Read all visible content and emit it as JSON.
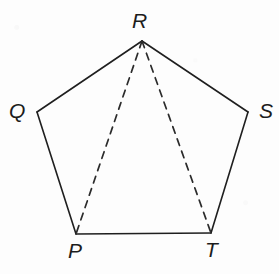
{
  "figure": {
    "shape_name": "pentagon",
    "background_color": "#fdfdfd",
    "solid_stroke_color": "#1f1f1f",
    "dashed_stroke_color": "#2b2b2b",
    "solid_stroke_width": 1.6,
    "dashed_stroke_width": 1.7,
    "dash_pattern": "7,6",
    "vertices": [
      {
        "id": "P",
        "label": "P",
        "x": 76,
        "y": 234,
        "label_x": 68,
        "label_y": 240
      },
      {
        "id": "Q",
        "label": "Q",
        "x": 37,
        "y": 112,
        "label_x": 9,
        "label_y": 100
      },
      {
        "id": "R",
        "label": "R",
        "x": 142,
        "y": 41,
        "label_x": 132,
        "label_y": 10
      },
      {
        "id": "S",
        "label": "S",
        "x": 248,
        "y": 112,
        "label_x": 259,
        "label_y": 100
      },
      {
        "id": "T",
        "label": "T",
        "x": 211,
        "y": 233,
        "label_x": 205,
        "label_y": 239
      }
    ],
    "solid_edges": [
      {
        "name": "edge-PQ",
        "from": "P",
        "to": "Q"
      },
      {
        "name": "edge-QR",
        "from": "Q",
        "to": "R"
      },
      {
        "name": "edge-RS",
        "from": "R",
        "to": "S"
      },
      {
        "name": "edge-ST",
        "from": "S",
        "to": "T"
      },
      {
        "name": "edge-TP",
        "from": "T",
        "to": "P"
      }
    ],
    "dashed_edges": [
      {
        "name": "diagonal-RP",
        "from": "R",
        "to": "P"
      },
      {
        "name": "diagonal-RT",
        "from": "R",
        "to": "T"
      }
    ]
  }
}
